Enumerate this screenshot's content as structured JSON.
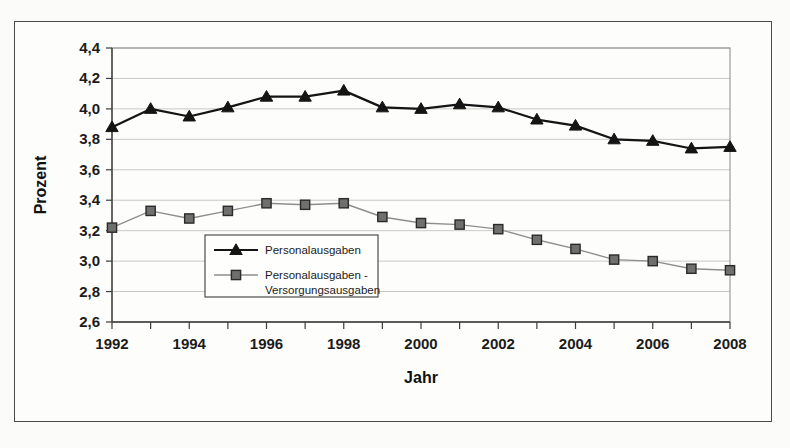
{
  "chart_data": {
    "type": "line",
    "title": "",
    "xlabel": "Jahr",
    "ylabel": "Prozent",
    "x": [
      1992,
      1993,
      1994,
      1995,
      1996,
      1997,
      1998,
      1999,
      2000,
      2001,
      2002,
      2003,
      2004,
      2005,
      2006,
      2007,
      2008
    ],
    "categories": [
      "1992",
      "1993",
      "1994",
      "1995",
      "1996",
      "1997",
      "1998",
      "1999",
      "2000",
      "2001",
      "2002",
      "2003",
      "2004",
      "2005",
      "2006",
      "2007",
      "2008"
    ],
    "xtick_labels": [
      "1992",
      "1994",
      "1996",
      "1998",
      "2000",
      "2002",
      "2004",
      "2006",
      "2008"
    ],
    "ytick_labels": [
      "2,6",
      "2,8",
      "3,0",
      "3,2",
      "3,4",
      "3,6",
      "3,8",
      "4,0",
      "4,2",
      "4,4"
    ],
    "ylim": [
      2.6,
      4.4
    ],
    "xlim": [
      1992,
      2008
    ],
    "ytick_step": 0.2,
    "grid": true,
    "legend_position": "inside-lower-left",
    "series": [
      {
        "name": "Personalausgaben",
        "marker": "triangle",
        "color": "#141414",
        "values": [
          3.88,
          4.0,
          3.95,
          4.01,
          4.08,
          4.08,
          4.12,
          4.01,
          4.0,
          4.03,
          4.01,
          3.93,
          3.89,
          3.8,
          3.79,
          3.74,
          3.75
        ]
      },
      {
        "name": "Personalausgaben - Versorgungsausgaben",
        "marker": "square",
        "color": "#6f6f6d",
        "values": [
          3.22,
          3.33,
          3.28,
          3.33,
          3.38,
          3.37,
          3.38,
          3.29,
          3.25,
          3.24,
          3.21,
          3.14,
          3.08,
          3.01,
          3.0,
          2.95,
          2.94
        ]
      }
    ]
  },
  "legend": {
    "entries": [
      {
        "label": "Personalausgaben",
        "line1": "Personalausgaben",
        "line2": ""
      },
      {
        "label": "Personalausgaben - Versorgungsausgaben",
        "line1": "Personalausgaben -",
        "line2": "Versorgungsausgaben"
      }
    ]
  },
  "axes": {
    "y_title": "Prozent",
    "x_title": "Jahr"
  }
}
